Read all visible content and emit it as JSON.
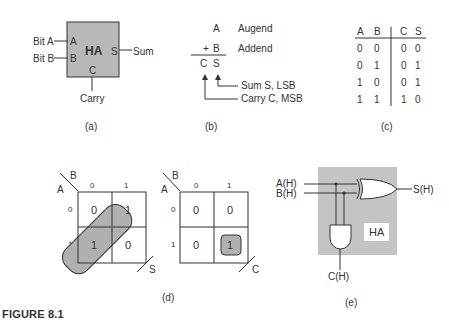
{
  "figure_label": "FIGURE 8.1",
  "panel_a": {
    "caption": "(a)",
    "block_label": "HA",
    "input_a_port": "A",
    "input_b_port": "B",
    "output_s_port": "S",
    "output_c_port": "C",
    "input_a_signal": "Bit A",
    "input_b_signal": "Bit B",
    "sum_signal": "Sum",
    "carry_signal": "Carry",
    "block_color": "#b8b8b8"
  },
  "panel_b": {
    "caption": "(b)",
    "augend_var": "A",
    "augend_label": "Augend",
    "plus": "+",
    "addend_var": "B",
    "addend_label": "Addend",
    "result_c": "C",
    "result_s": "S",
    "sum_note": "Sum S,  LSB",
    "carry_note": "Carry C,  MSB"
  },
  "panel_c": {
    "caption": "(c)",
    "headers": [
      "A",
      "B",
      "C",
      "S"
    ],
    "rows": [
      [
        "0",
        "0",
        "0",
        "0"
      ],
      [
        "0",
        "1",
        "0",
        "1"
      ],
      [
        "1",
        "0",
        "0",
        "1"
      ],
      [
        "1",
        "1",
        "1",
        "0"
      ]
    ]
  },
  "panel_d": {
    "caption": "(d)",
    "kmap_s": {
      "row_var": "A",
      "col_var": "B",
      "output": "S",
      "col_labels": [
        "0",
        "1"
      ],
      "row_labels": [
        "0",
        "1"
      ],
      "cells": [
        [
          "0",
          "1"
        ],
        [
          "1",
          "0"
        ]
      ]
    },
    "kmap_c": {
      "row_var": "A",
      "col_var": "B",
      "output": "C",
      "col_labels": [
        "0",
        "1"
      ],
      "row_labels": [
        "0",
        "1"
      ],
      "cells": [
        [
          "0",
          "0"
        ],
        [
          "0",
          "1"
        ]
      ]
    },
    "loop_color": "#b0b0b0"
  },
  "panel_e": {
    "caption": "(e)",
    "input_a": "A(H)",
    "input_b": "B(H)",
    "output_s": "S(H)",
    "output_c": "C(H)",
    "block_label": "HA",
    "block_color": "#c4c4c4"
  }
}
